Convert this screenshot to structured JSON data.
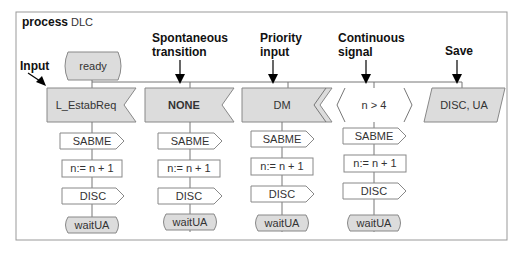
{
  "frame": {
    "keyword": "process",
    "name": "DLC"
  },
  "state_start": "ready",
  "annotations": {
    "input": "Input",
    "spontaneous": [
      "Spontaneous",
      "transition"
    ],
    "priority": [
      "Priority",
      "input"
    ],
    "continuous": [
      "Continuous",
      "signal"
    ],
    "save": "Save"
  },
  "triggers": {
    "input": "L_EstabReq",
    "spontaneous": "NONE",
    "priority": "DM",
    "continuous": "n > 4",
    "save": "DISC, UA"
  },
  "branch": {
    "output1": "SABME",
    "task": "n:= n + 1",
    "output2": "DISC",
    "next_state": "waitUA"
  },
  "colors": {
    "fill": "#dcdcdc",
    "stroke": "#888888",
    "frame": "#999999"
  }
}
